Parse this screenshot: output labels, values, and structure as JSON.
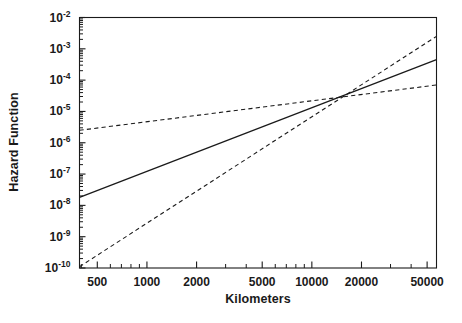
{
  "figure": {
    "background": "#ffffff",
    "ink": "#1a1a1a"
  },
  "chart_data": {
    "type": "line",
    "title": "",
    "xlabel": "Kilometers",
    "ylabel": "Hazard Function",
    "xscale": "log",
    "yscale": "log",
    "xlim": [
      390,
      57000
    ],
    "ylim": [
      1e-10,
      0.01
    ],
    "grid": false,
    "legend": "none",
    "xticks": [
      500,
      1000,
      2000,
      5000,
      10000,
      20000,
      50000
    ],
    "xtick_labels": [
      "500",
      "1000",
      "2000",
      "5000",
      "10000",
      "20000",
      "50000"
    ],
    "yticks": [
      0.01,
      0.001,
      0.0001,
      1e-05,
      1e-06,
      1e-07,
      1e-08,
      1e-09,
      1e-10
    ],
    "ytick_labels": [
      "10-2",
      "10-3",
      "10-4",
      "10-5",
      "10-6",
      "10-7",
      "10-8",
      "10-9",
      "10-10"
    ],
    "ytick_mantissa": "10",
    "ytick_exponents": [
      "-2",
      "-3",
      "-4",
      "-5",
      "-6",
      "-7",
      "-8",
      "-9",
      "-10"
    ],
    "series": [
      {
        "name": "Hazard function estimate",
        "style": "solid",
        "color": "#1a1a1a",
        "width": 1.3,
        "x": [
          390,
          57000
        ],
        "y": [
          1.8e-08,
          0.00045
        ]
      },
      {
        "name": "Confidence bound (shallow)",
        "style": "dashed",
        "color": "#1a1a1a",
        "width": 1.1,
        "x": [
          390,
          57000
        ],
        "y": [
          2.5e-06,
          7e-05
        ]
      },
      {
        "name": "Confidence bound (steep)",
        "style": "dashed",
        "color": "#1a1a1a",
        "width": 1.1,
        "x": [
          390,
          57000
        ],
        "y": [
          1.1e-10,
          0.0025
        ]
      }
    ],
    "annotations": []
  }
}
